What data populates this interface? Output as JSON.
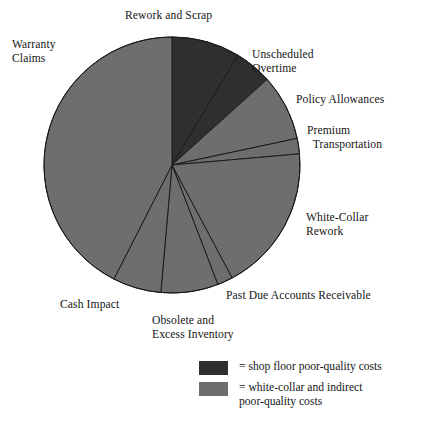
{
  "chart_data": {
    "type": "pie",
    "title": "",
    "subtitle": "",
    "xlabel": "",
    "ylabel": "",
    "grid": false,
    "legend_position": "bottom-right",
    "start_angle_deg": 0,
    "direction": "clockwise",
    "center": {
      "cx": 172,
      "cy": 165,
      "r": 128
    },
    "categories": [
      "Rework and Scrap",
      "Unscheduled Overtime",
      "Policy Allowances",
      "Premium Transportation",
      "White-Collar Rework",
      "Past Due Accounts Receivable",
      "Obsolete and Excess Inventory",
      "Cash Impact",
      "Warranty Claims"
    ],
    "values": [
      8.6,
      4.7,
      8.3,
      1.9,
      18.6,
      1.9,
      7.2,
      6.1,
      42.5
    ],
    "slices": [
      {
        "label": "Rework and Scrap",
        "start_deg": 0,
        "end_deg": 31,
        "percent": 8.6,
        "group": "shop-floor",
        "color": "#2f2f2f"
      },
      {
        "label": "Unscheduled Overtime",
        "start_deg": 31,
        "end_deg": 48,
        "percent": 4.7,
        "group": "shop-floor",
        "color": "#2f2f2f"
      },
      {
        "label": "Policy Allowances",
        "start_deg": 48,
        "end_deg": 78,
        "percent": 8.3,
        "group": "white-collar",
        "color": "#6e6e6e"
      },
      {
        "label": "Premium Transportation",
        "start_deg": 78,
        "end_deg": 85,
        "percent": 1.9,
        "group": "white-collar",
        "color": "#6e6e6e"
      },
      {
        "label": "White-Collar Rework",
        "start_deg": 85,
        "end_deg": 152,
        "percent": 18.6,
        "group": "white-collar",
        "color": "#6e6e6e"
      },
      {
        "label": "Past Due Accounts Receivable",
        "start_deg": 152,
        "end_deg": 159,
        "percent": 1.9,
        "group": "white-collar",
        "color": "#6e6e6e"
      },
      {
        "label": "Obsolete and Excess Inventory",
        "start_deg": 159,
        "end_deg": 185,
        "percent": 7.2,
        "group": "white-collar",
        "color": "#6e6e6e"
      },
      {
        "label": "Cash Impact",
        "start_deg": 185,
        "end_deg": 207,
        "percent": 6.1,
        "group": "white-collar",
        "color": "#6e6e6e"
      },
      {
        "label": "Warranty Claims",
        "start_deg": 207,
        "end_deg": 360,
        "percent": 42.5,
        "group": "white-collar",
        "color": "#6e6e6e"
      }
    ],
    "colors": {
      "shop_floor": "#2f2f2f",
      "white_collar": "#6e6e6e",
      "slice_edge": "#1b1b1b",
      "background": "#ffffff",
      "text": "#151515"
    }
  },
  "labels": {
    "rework_and_scrap": "Rework and Scrap",
    "unscheduled_overtime": "Unscheduled\nOvertime",
    "policy_allowances": "Policy Allowances",
    "premium_transportation": "Premium\n  Transportation",
    "white_collar_rework": "White-Collar\nRework",
    "past_due_accounts_receivable": "Past Due Accounts Receivable",
    "obsolete_excess_inventory": "Obsolete and\nExcess Inventory",
    "cash_impact": "Cash Impact",
    "warranty_claims": "Warranty\nClaims"
  },
  "legend": {
    "items": [
      {
        "swatch_color": "#2f2f2f",
        "text": "= shop floor poor-quality costs"
      },
      {
        "swatch_color": "#6e6e6e",
        "text": "= white-collar and indirect\n   poor-quality costs"
      }
    ]
  }
}
